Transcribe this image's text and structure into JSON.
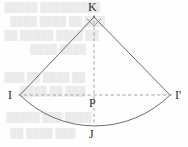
{
  "figure": {
    "background_color": "#fefefe",
    "stroke_color": "#6d6d6d",
    "dash_color": "#9a9a9a",
    "label_color": "#2b2b2b",
    "bleed_color": "#ebebed",
    "labels": {
      "apex": "K",
      "left_vertex": "I",
      "right_vertex": "I'",
      "center": "P",
      "arc_midpoint": "J"
    },
    "points": {
      "K": {
        "x": 94,
        "y": 17
      },
      "I": {
        "x": 20,
        "y": 95
      },
      "I_prime": {
        "x": 170,
        "y": 95
      },
      "P": {
        "x": 94,
        "y": 95
      },
      "J": {
        "x": 94,
        "y": 123
      }
    },
    "angle_marker": {
      "name": "right-angle",
      "value": "90",
      "unit": "degrees"
    },
    "elements": {
      "left_radius": "K-I",
      "right_radius": "K-I'",
      "arc": "I-J-I'",
      "chord_dashed": "I-I'",
      "axis_dashed": "K-J"
    }
  },
  "bleed_through": {
    "lines": [
      {
        "text": "█████████ █████",
        "x": 4,
        "y": 2
      },
      {
        "text": "███ ██  ████ ████",
        "x": 10,
        "y": 16
      },
      {
        "text": "██  ████ █████ ██",
        "x": 4,
        "y": 30
      },
      {
        "text": "████  ████",
        "x": 30,
        "y": 44
      },
      {
        "text": "██ ████ ██ ███",
        "x": 4,
        "y": 72
      },
      {
        "text": "███ ██ ████",
        "x": 20,
        "y": 86
      },
      {
        "text": "████ ███ █████",
        "x": 6,
        "y": 112
      },
      {
        "text": "███ ████ ██",
        "x": 10,
        "y": 128
      }
    ]
  }
}
